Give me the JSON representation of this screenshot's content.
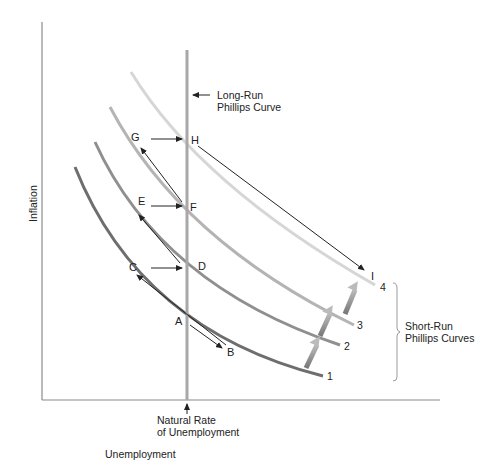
{
  "axes": {
    "y_label": "Inflation",
    "x_label": "Unemployment"
  },
  "long_run_curve": {
    "label_line1": "Long-Run",
    "label_line2": "Phillips Curve"
  },
  "natural_rate": {
    "label_line1": "Natural Rate",
    "label_line2": "of Unemployment"
  },
  "short_run_curves": {
    "group_label_line1": "Short-Run",
    "group_label_line2": "Phillips Curves",
    "curves": [
      {
        "id": "1",
        "label": "1",
        "color": "#6e6e6e"
      },
      {
        "id": "2",
        "label": "2",
        "color": "#8f8f8f"
      },
      {
        "id": "3",
        "label": "3",
        "color": "#b4b4b4"
      },
      {
        "id": "4",
        "label": "4",
        "color": "#d6d6d6"
      }
    ]
  },
  "points": {
    "A": "A",
    "B": "B",
    "C": "C",
    "D": "D",
    "E": "E",
    "F": "F",
    "G": "G",
    "H": "H",
    "I": "I"
  },
  "colors": {
    "axis": "#8a8a8a",
    "long_run": "#a8a8a8",
    "arrow": "#333333",
    "shift_arrow": "#8c8c8c"
  }
}
